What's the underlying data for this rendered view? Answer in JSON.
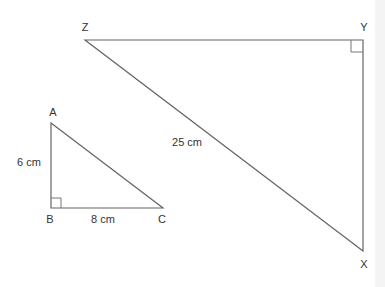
{
  "diagram": {
    "type": "similar-right-triangles",
    "colors": {
      "line": "#555555",
      "text": "#333333",
      "background": "#ffffff"
    },
    "small_triangle": {
      "vertices": {
        "A": "A",
        "B": "B",
        "C": "C"
      },
      "right_angle_at": "B",
      "sides": {
        "AB": "6 cm",
        "BC": "8 cm"
      }
    },
    "large_triangle": {
      "vertices": {
        "X": "X",
        "Y": "Y",
        "Z": "Z"
      },
      "right_angle_at": "Y",
      "sides": {
        "ZX": "25 cm"
      }
    }
  }
}
